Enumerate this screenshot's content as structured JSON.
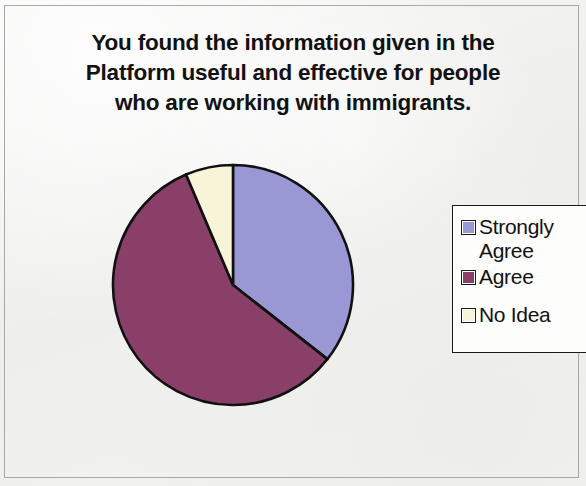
{
  "chart_data": {
    "type": "pie",
    "title": "You found the information given in the Platform useful and effective for people who are working with immigrants.",
    "title_lines": [
      "You found the information given in the",
      "Platform useful and effective for people",
      "who are working with immigrants."
    ],
    "categories": [
      "Strongly Agree",
      "Agree",
      "No Idea"
    ],
    "values": [
      35.6,
      58.0,
      6.4
    ],
    "value_unit": "percent",
    "angles_deg": [
      128,
      209,
      23
    ],
    "colors": [
      "#9a98d4",
      "#8a3f68",
      "#f7f4d8"
    ],
    "slice_outline_color": "#111111",
    "start_angle_deg": 0,
    "direction": "clockwise",
    "legend_position": "right",
    "grid": false,
    "xlabel": "",
    "ylabel": "",
    "data_labels_shown": false
  },
  "legend": {
    "entries": [
      {
        "label": "Strongly Agree",
        "color": "#9a98d4"
      },
      {
        "label": "Agree",
        "color": "#8a3f68"
      },
      {
        "label": "No Idea",
        "color": "#f7f4d8"
      }
    ]
  }
}
